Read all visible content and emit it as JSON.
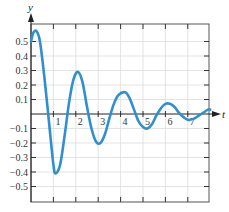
{
  "chart_data": {
    "type": "line",
    "title": "",
    "xlabel": "t",
    "ylabel": "y",
    "xlim": [
      0,
      8
    ],
    "ylim": [
      -0.6,
      0.6
    ],
    "grid": true,
    "legend": null,
    "x_ticks": [
      1,
      2,
      3,
      4,
      5,
      6,
      7
    ],
    "x_tick_labels": [
      "1",
      "2",
      "3",
      "4",
      "5",
      "6",
      "7"
    ],
    "y_ticks": [
      0.5,
      0.4,
      0.3,
      0.2,
      0.1,
      -0.1,
      -0.2,
      -0.3,
      -0.4,
      -0.5
    ],
    "y_tick_labels": [
      "0.5",
      "0.4",
      "0.3",
      "0.2",
      "0.1",
      "−0.1",
      "−0.2",
      "−0.3",
      "−0.4",
      "−0.5"
    ],
    "series": [
      {
        "name": "y(t)",
        "color": "#2f8fcf",
        "x": [
          0,
          0.1,
          0.25,
          0.4,
          0.6,
          0.8,
          1.0,
          1.1,
          1.3,
          1.5,
          1.7,
          1.9,
          2.1,
          2.3,
          2.5,
          2.7,
          2.9,
          3.1,
          3.3,
          3.5,
          3.7,
          3.9,
          4.2,
          4.4,
          4.6,
          4.8,
          5.0,
          5.2,
          5.4,
          5.6,
          5.8,
          6.0,
          6.2,
          6.4,
          6.6,
          6.8,
          7.0,
          7.1,
          7.3,
          7.5,
          7.7,
          7.9,
          8.0
        ],
        "y": [
          0.5,
          0.56,
          0.57,
          0.5,
          0.25,
          -0.05,
          -0.35,
          -0.41,
          -0.35,
          -0.15,
          0.08,
          0.24,
          0.29,
          0.22,
          0.05,
          -0.1,
          -0.19,
          -0.2,
          -0.14,
          -0.03,
          0.07,
          0.13,
          0.15,
          0.11,
          0.03,
          -0.05,
          -0.09,
          -0.1,
          -0.07,
          -0.01,
          0.04,
          0.07,
          0.07,
          0.05,
          0.01,
          -0.02,
          -0.04,
          -0.04,
          -0.03,
          -0.01,
          0.01,
          0.03,
          0.03
        ]
      }
    ],
    "colors": {
      "curve": "#2f8fcf",
      "axis": "#222222",
      "grid": "#dcdcdc",
      "frame": "#444444"
    }
  }
}
